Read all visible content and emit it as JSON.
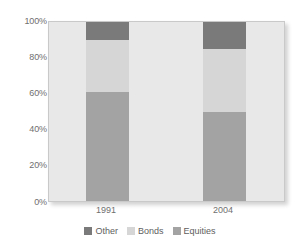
{
  "chart_data": {
    "type": "bar",
    "title": "",
    "subtitle": "",
    "xlabel": "",
    "ylabel": "",
    "stacked": true,
    "normalized": true,
    "grid": false,
    "legend_position": "bottom",
    "ylim": [
      0,
      100
    ],
    "ytick_labels": [
      "100%",
      "80%",
      "60%",
      "40%",
      "20%",
      "0%"
    ],
    "ytick_values": [
      100,
      80,
      60,
      40,
      20,
      0
    ],
    "categories": [
      "1991",
      "2004"
    ],
    "series": [
      {
        "name": "Equities",
        "color": "#a3a3a3",
        "values": [
          61,
          50
        ]
      },
      {
        "name": "Bonds",
        "color": "#d6d6d6",
        "values": [
          29,
          35
        ]
      },
      {
        "name": "Other",
        "color": "#7a7a7a",
        "values": [
          10,
          15
        ]
      }
    ],
    "legend_order": [
      "Other",
      "Bonds",
      "Equities"
    ],
    "plot_background": "#e8e8e8",
    "axis_text_color": "#6f6f6f"
  },
  "axis": {
    "y_ticks": [
      {
        "label": "100%",
        "value": 100
      },
      {
        "label": "80%",
        "value": 80
      },
      {
        "label": "60%",
        "value": 60
      },
      {
        "label": "40%",
        "value": 40
      },
      {
        "label": "20%",
        "value": 20
      },
      {
        "label": "0%",
        "value": 0
      }
    ],
    "x_ticks": [
      {
        "label": "1991"
      },
      {
        "label": "2004"
      }
    ]
  },
  "legend": {
    "items": [
      {
        "label": "Other",
        "color": "#7a7a7a"
      },
      {
        "label": "Bonds",
        "color": "#d6d6d6"
      },
      {
        "label": "Equities",
        "color": "#a3a3a3"
      }
    ]
  }
}
